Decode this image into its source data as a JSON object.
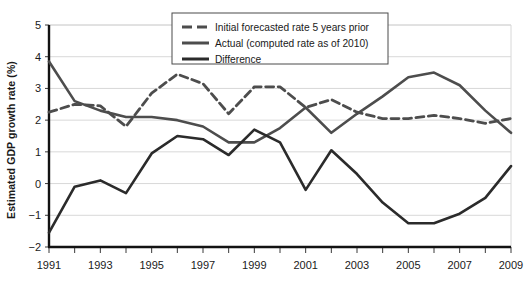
{
  "chart_data": {
    "type": "line",
    "title": "",
    "xlabel": "",
    "ylabel": "Estimated GDP growth rate (%)",
    "x": [
      1991,
      1992,
      1993,
      1994,
      1995,
      1996,
      1997,
      1998,
      1999,
      2000,
      2001,
      2002,
      2003,
      2004,
      2005,
      2006,
      2007,
      2008,
      2009
    ],
    "xtick_labels": [
      "1991",
      "1993",
      "1995",
      "1997",
      "1999",
      "2001",
      "2003",
      "2005",
      "2007",
      "2009"
    ],
    "xtick_values": [
      1991,
      1993,
      1995,
      1997,
      1999,
      2001,
      2003,
      2005,
      2007,
      2009
    ],
    "ytick_labels": [
      "5",
      "4",
      "3",
      "2",
      "1",
      "0",
      "−1",
      "−2"
    ],
    "ytick_values": [
      5,
      4,
      3,
      2,
      1,
      0,
      -1,
      -2
    ],
    "xlim": [
      1991,
      2009
    ],
    "ylim": [
      -2,
      5
    ],
    "grid": true,
    "legend_position": "top-center",
    "series": [
      {
        "name": "Initial forecasted rate 5 years prior",
        "style": "dashed",
        "color": "#4d4d4d",
        "width": 2.8,
        "values": [
          2.25,
          2.5,
          2.45,
          1.8,
          2.85,
          3.45,
          3.15,
          2.2,
          3.05,
          3.05,
          2.4,
          2.65,
          2.25,
          2.05,
          2.05,
          2.15,
          2.05,
          1.9,
          2.05
        ]
      },
      {
        "name": "Actual (computed rate as of 2010)",
        "style": "solid",
        "color": "#4d4d4d",
        "width": 2.6,
        "values": [
          3.85,
          2.6,
          2.3,
          2.1,
          2.1,
          2.0,
          1.8,
          1.3,
          1.3,
          1.75,
          2.4,
          1.6,
          2.2,
          2.75,
          3.35,
          3.5,
          3.1,
          2.3,
          1.6
        ]
      },
      {
        "name": "Difference",
        "style": "solid",
        "color": "#2b2b2b",
        "width": 2.6,
        "values": [
          -1.55,
          -0.1,
          0.1,
          -0.3,
          0.95,
          1.5,
          1.4,
          0.9,
          1.7,
          1.3,
          -0.2,
          1.05,
          0.3,
          -0.6,
          -1.25,
          -1.25,
          -0.95,
          -0.45,
          0.55
        ]
      }
    ]
  },
  "legend": {
    "entries": [
      "Initial forecasted rate 5 years prior",
      "Actual (computed rate as of 2010)",
      "Difference"
    ]
  },
  "axis": {
    "y_title": "Estimated GDP growth rate (%)"
  }
}
